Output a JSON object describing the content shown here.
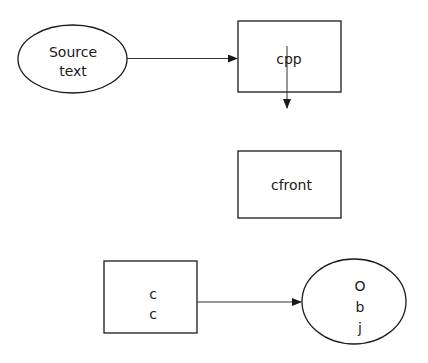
{
  "diagram": {
    "nodes": [
      {
        "id": "source",
        "shape": "ellipse",
        "lines": [
          "Source",
          "text"
        ]
      },
      {
        "id": "cpp",
        "shape": "rectangle",
        "label": "cpp"
      },
      {
        "id": "cfront",
        "shape": "rectangle",
        "label": "cfront"
      },
      {
        "id": "cc",
        "shape": "rectangle",
        "lines": [
          "c",
          "c"
        ]
      },
      {
        "id": "obj",
        "shape": "ellipse",
        "lines": [
          "O",
          "b",
          "j",
          "e"
        ]
      }
    ],
    "edges": [
      {
        "from": "source",
        "to": "cpp"
      },
      {
        "from": "cpp",
        "to": "below-cpp"
      },
      {
        "from": "cc",
        "to": "obj"
      }
    ],
    "colors": {
      "stroke": "#1a1a1a",
      "background": "#ffffff"
    }
  }
}
